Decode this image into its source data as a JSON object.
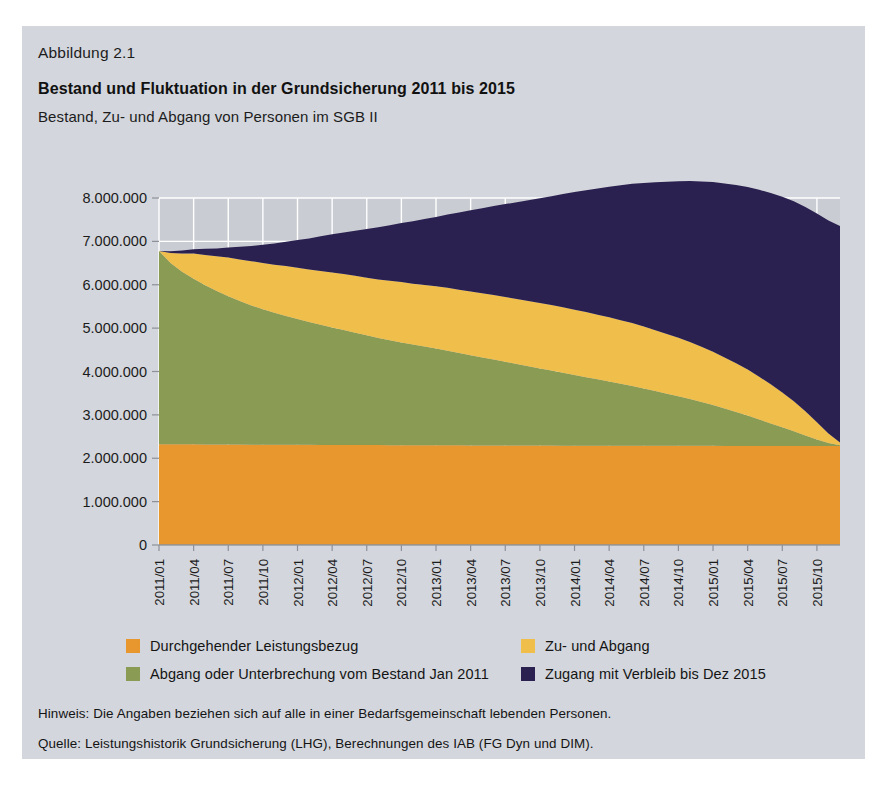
{
  "figure": {
    "number_label": "Abbildung 2.1",
    "title": "Bestand und Fluktuation in der Grundsicherung 2011 bis 2015",
    "subtitle": "Bestand, Zu- und Abgang von Personen im SGB II",
    "note": "Hinweis: Die Angaben beziehen sich auf alle in einer Bedarfsgemeinschaft lebenden Personen.",
    "source": "Quelle: Leistungshistorik Grundsicherung (LHG), Berechnungen des IAB (FG Dyn und DIM)."
  },
  "colors": {
    "card_background": "#d3d6dc",
    "plot_background": "#c9ccd3",
    "gridline": "#ffffff",
    "orange": "#e8962e",
    "green": "#8a9b54",
    "yellow": "#f0be4a",
    "navy": "#2b2150",
    "text": "#141414"
  },
  "legend": {
    "position": "bottom",
    "entries": [
      {
        "label": "Durchgehender Leistungsbezug",
        "color": "#e8962e",
        "column": "left",
        "row": 1
      },
      {
        "label": "Abgang oder Unterbrechung vom Bestand Jan 2011",
        "color": "#8a9b54",
        "column": "left",
        "row": 2
      },
      {
        "label": "Zu- und Abgang",
        "color": "#f0be4a",
        "column": "right",
        "row": 1
      },
      {
        "label": "Zugang mit Verbleib bis Dez 2015",
        "color": "#2b2150",
        "column": "right",
        "row": 2
      }
    ]
  },
  "chart_data": {
    "type": "area",
    "stacked": true,
    "title": "Bestand und Fluktuation in der Grundsicherung 2011 bis 2015",
    "subtitle": "Bestand, Zu- und Abgang von Personen im SGB II",
    "xlabel": "",
    "ylabel": "",
    "ylim": [
      0,
      8000000
    ],
    "ytick_step": 1000000,
    "ytick_labels": [
      "0",
      "1.000.000",
      "2.000.000",
      "3.000.000",
      "4.000.000",
      "5.000.000",
      "6.000.000",
      "7.000.000",
      "8.000.000"
    ],
    "ytick_values": [
      0,
      1000000,
      2000000,
      3000000,
      4000000,
      5000000,
      6000000,
      7000000,
      8000000
    ],
    "grid": true,
    "xtick_labels": [
      "2011/01",
      "2011/04",
      "2011/07",
      "2011/10",
      "2012/01",
      "2012/04",
      "2012/07",
      "2012/10",
      "2013/01",
      "2013/04",
      "2013/07",
      "2013/10",
      "2014/01",
      "2014/04",
      "2014/07",
      "2014/10",
      "2015/01",
      "2015/04",
      "2015/07",
      "2015/10"
    ],
    "x": [
      "2011/01",
      "2011/02",
      "2011/03",
      "2011/04",
      "2011/05",
      "2011/06",
      "2011/07",
      "2011/08",
      "2011/09",
      "2011/10",
      "2011/11",
      "2011/12",
      "2012/01",
      "2012/02",
      "2012/03",
      "2012/04",
      "2012/05",
      "2012/06",
      "2012/07",
      "2012/08",
      "2012/09",
      "2012/10",
      "2012/11",
      "2012/12",
      "2013/01",
      "2013/02",
      "2013/03",
      "2013/04",
      "2013/05",
      "2013/06",
      "2013/07",
      "2013/08",
      "2013/09",
      "2013/10",
      "2013/11",
      "2013/12",
      "2014/01",
      "2014/02",
      "2014/03",
      "2014/04",
      "2014/05",
      "2014/06",
      "2014/07",
      "2014/08",
      "2014/09",
      "2014/10",
      "2014/11",
      "2014/12",
      "2015/01",
      "2015/02",
      "2015/03",
      "2015/04",
      "2015/05",
      "2015/06",
      "2015/07",
      "2015/08",
      "2015/09",
      "2015/10",
      "2015/11",
      "2015/12"
    ],
    "series": [
      {
        "name": "Durchgehender Leistungsbezug",
        "color": "#e8962e",
        "values": [
          2320000,
          2320000,
          2320000,
          2320000,
          2318000,
          2318000,
          2316000,
          2315000,
          2314000,
          2313000,
          2312000,
          2311000,
          2310000,
          2309000,
          2308000,
          2307000,
          2306000,
          2305000,
          2304000,
          2303000,
          2302000,
          2301000,
          2300000,
          2300000,
          2299000,
          2298000,
          2297000,
          2296000,
          2295000,
          2295000,
          2294000,
          2293000,
          2293000,
          2292000,
          2292000,
          2291000,
          2291000,
          2290000,
          2290000,
          2289000,
          2289000,
          2288000,
          2288000,
          2288000,
          2287000,
          2287000,
          2286000,
          2286000,
          2286000,
          2285000,
          2285000,
          2284000,
          2284000,
          2284000,
          2283000,
          2283000,
          2283000,
          2282000,
          2282000,
          2282000
        ]
      },
      {
        "name": "Abgang oder Unterbrechung vom Bestand Jan 2011",
        "color": "#8a9b54",
        "values": [
          4460000,
          4180000,
          3980000,
          3820000,
          3670000,
          3540000,
          3420000,
          3310000,
          3210000,
          3120000,
          3040000,
          2970000,
          2900000,
          2830000,
          2770000,
          2710000,
          2650000,
          2590000,
          2530000,
          2470000,
          2420000,
          2370000,
          2320000,
          2275000,
          2230000,
          2180000,
          2130000,
          2080000,
          2030000,
          1980000,
          1930000,
          1880000,
          1830000,
          1780000,
          1730000,
          1680000,
          1630000,
          1580000,
          1530000,
          1480000,
          1430000,
          1380000,
          1320000,
          1260000,
          1200000,
          1140000,
          1080000,
          1010000,
          940000,
          860000,
          780000,
          700000,
          610000,
          520000,
          430000,
          340000,
          240000,
          150000,
          70000,
          20000
        ]
      },
      {
        "name": "Zu- und Abgang",
        "color": "#f0be4a",
        "values": [
          0,
          230000,
          420000,
          580000,
          700000,
          800000,
          890000,
          960000,
          1020000,
          1070000,
          1110000,
          1150000,
          1180000,
          1210000,
          1240000,
          1265000,
          1290000,
          1310000,
          1330000,
          1350000,
          1370000,
          1390000,
          1405000,
          1420000,
          1435000,
          1450000,
          1460000,
          1470000,
          1480000,
          1490000,
          1495000,
          1500000,
          1505000,
          1510000,
          1510000,
          1510000,
          1505000,
          1500000,
          1490000,
          1480000,
          1465000,
          1450000,
          1430000,
          1405000,
          1380000,
          1350000,
          1315000,
          1275000,
          1230000,
          1180000,
          1125000,
          1060000,
          985000,
          900000,
          805000,
          690000,
          560000,
          400000,
          220000,
          60000
        ]
      },
      {
        "name": "Zugang mit Verbleib bis Dez 2015",
        "color": "#2b2150",
        "values": [
          0,
          40000,
          70000,
          100000,
          140000,
          180000,
          230000,
          290000,
          350000,
          420000,
          490000,
          560000,
          640000,
          720000,
          800000,
          880000,
          960000,
          1040000,
          1120000,
          1200000,
          1280000,
          1360000,
          1440000,
          1520000,
          1600000,
          1690000,
          1780000,
          1870000,
          1960000,
          2050000,
          2140000,
          2230000,
          2320000,
          2410000,
          2510000,
          2610000,
          2710000,
          2810000,
          2910000,
          3010000,
          3110000,
          3210000,
          3310000,
          3410000,
          3510000,
          3610000,
          3710000,
          3810000,
          3910000,
          4010000,
          4110000,
          4210000,
          4310000,
          4410000,
          4510000,
          4610000,
          4710000,
          4810000,
          4910000,
          4990000
        ]
      }
    ],
    "totals_note": "Gesamtbestand startet bei ca. 6.78 Mio. und endet bei ca. 6.3 Mio."
  }
}
